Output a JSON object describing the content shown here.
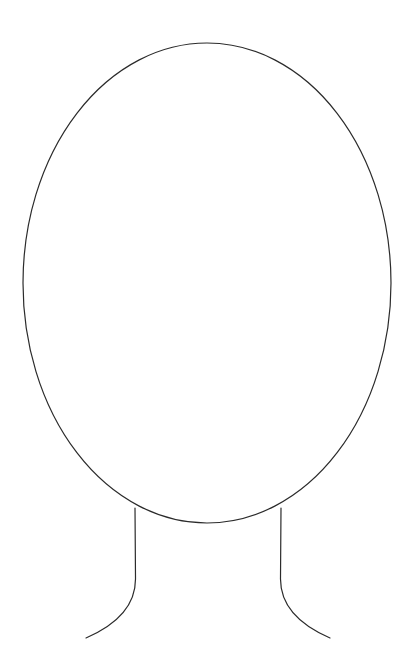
{
  "canvas": {
    "width": 413,
    "height": 672,
    "background_color": "#ffffff",
    "title": "Head and Neck Outline Drawing"
  },
  "drawing": {
    "style": "line-art-outline",
    "stroke_color": "#2b2b2b",
    "stroke_width": 1.2,
    "fill_color": "none",
    "description": "Blank head and shoulders outline: one large vertical ellipse with two symmetric neck curves below",
    "shapes": [
      {
        "name": "head-ellipse",
        "type": "ellipse",
        "center_x": 207,
        "center_y": 283,
        "radius_x": 184,
        "radius_y": 240,
        "left_edge": 23,
        "right_edge": 391,
        "top_edge": 43,
        "bottom_edge": 523,
        "stroke_color": "#2b2b2b",
        "stroke_width": 1.2,
        "fill_color": "none"
      },
      {
        "name": "neck-line-left",
        "type": "path",
        "start_x": 135,
        "start_y": 508,
        "end_x": 86,
        "end_y": 638,
        "path_d": "M 135 508 L 135.5 578 C 136 606 116 625 86 638",
        "stroke_color": "#2b2b2b",
        "stroke_width": 1.2,
        "fill_color": "none"
      },
      {
        "name": "neck-line-right",
        "type": "path",
        "start_x": 281,
        "start_y": 508,
        "end_x": 330,
        "end_y": 638,
        "path_d": "M 281 508 L 280.5 578 C 280 606 300 625 330 638",
        "stroke_color": "#2b2b2b",
        "stroke_width": 1.2,
        "fill_color": "none"
      }
    ]
  }
}
